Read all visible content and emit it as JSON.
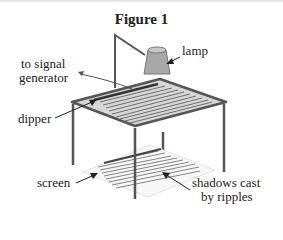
{
  "figure": {
    "title": "Figure 1",
    "labels": {
      "lamp": "lamp",
      "signal_line1": "to signal",
      "signal_line2": "generator",
      "dipper": "dipper",
      "screen": "screen",
      "shadows_line1": "shadows cast",
      "shadows_line2": "by ripples"
    },
    "colors": {
      "frame": "#555555",
      "tank_fill": "#d6d6d6",
      "ripple_line": "#6e6e6e",
      "lamp_fill": "#a8a8a8",
      "screen_fill": "#f7f7f7",
      "text": "#222222"
    }
  }
}
